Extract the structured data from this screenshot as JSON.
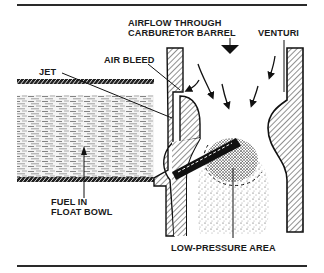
{
  "figure": {
    "labels": {
      "airflow_line1": "AIRFLOW THROUGH",
      "airflow_line2": "CARBURETOR BARREL",
      "venturi": "VENTURI",
      "air_bleed": "AIR BLEED",
      "jet": "JET",
      "fuel_line1": "FUEL IN",
      "fuel_line2": "FLOAT BOWL",
      "low_pressure": "LOW-PRESSURE AREA"
    },
    "colors": {
      "ink": "#1a1a1a",
      "background": "#ffffff"
    }
  }
}
